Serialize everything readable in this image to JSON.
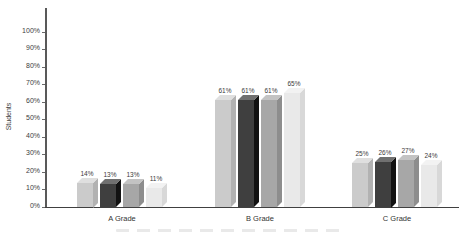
{
  "chart_data": {
    "type": "bar",
    "subtype": "3d-column-grayscale",
    "title": "",
    "xlabel": "",
    "ylabel": "Students",
    "ylim": [
      0,
      100
    ],
    "y_tick_step": 10,
    "y_tick_labels": [
      "0%",
      "10%",
      "20%",
      "30%",
      "40%",
      "50%",
      "60%",
      "70%",
      "80%",
      "90%",
      "100%"
    ],
    "grid": false,
    "legend": "none",
    "categories": [
      "A Grade",
      "B Grade",
      "C Grade"
    ],
    "series": [
      {
        "name": "series-1",
        "front_color": "#cbcbcb",
        "side_color": "#b2b2b2",
        "top_color": "#dfdfdf",
        "values": [
          14,
          61,
          25
        ]
      },
      {
        "name": "series-2",
        "front_color": "#3f3f3f",
        "side_color": "#121212",
        "top_color": "#707070",
        "values": [
          13,
          61,
          26
        ]
      },
      {
        "name": "series-3",
        "front_color": "#a7a7a7",
        "side_color": "#8d8d8d",
        "top_color": "#c3c3c3",
        "values": [
          13,
          61,
          27
        ]
      },
      {
        "name": "series-4",
        "front_color": "#e9e9e9",
        "side_color": "#d8d8d8",
        "top_color": "#f2f2f2",
        "values": [
          11,
          65,
          24
        ]
      }
    ],
    "data_label_suffix": "%",
    "data_labels_visible": true
  }
}
